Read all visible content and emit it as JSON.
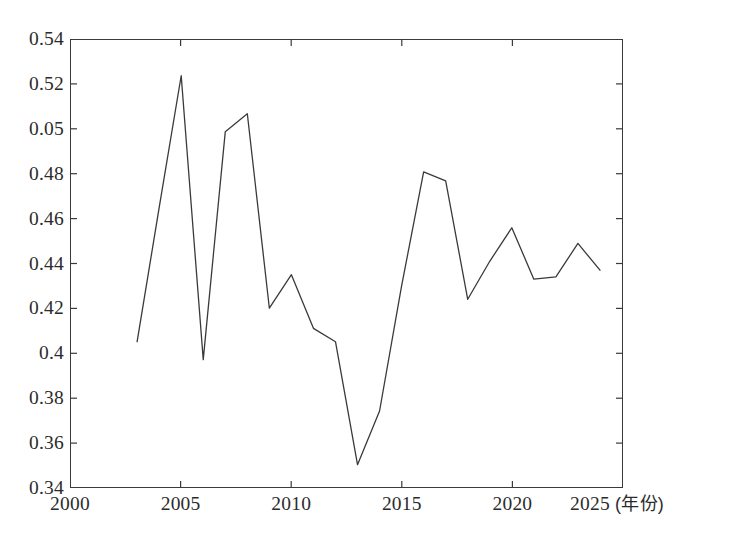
{
  "chart_data": {
    "type": "line",
    "title": "",
    "subtitle": "",
    "xlabel": "",
    "ylabel": "",
    "x_unit_label": "(年份)",
    "grid": false,
    "legend": null,
    "legend_position": "none",
    "xlim": [
      2000,
      2025
    ],
    "ylim": [
      0.34,
      0.54
    ],
    "x_tick_labels": [
      "2000",
      "2005",
      "2010",
      "2015",
      "2020",
      "2025"
    ],
    "x_ticks": [
      2000,
      2005,
      2010,
      2015,
      2020,
      2025
    ],
    "y_tick_labels": [
      "0.54",
      "0.52",
      "0.05",
      "0.48",
      "0.46",
      "0.44",
      "0.42",
      "0.4",
      "0.38",
      "0.36",
      "0.34"
    ],
    "y_ticks": [
      0.54,
      0.52,
      0.5,
      0.48,
      0.46,
      0.44,
      0.42,
      0.4,
      0.38,
      0.36,
      0.34
    ],
    "line_color": "#3a3a3a",
    "line_width": 1.3,
    "markers": false,
    "x": [
      2003,
      2004,
      2005,
      2006,
      2007,
      2008,
      2009,
      2010,
      2011,
      2012,
      2013,
      2014,
      2015,
      2016,
      2017,
      2018,
      2019,
      2020,
      2021,
      2022,
      2023,
      2024
    ],
    "values": [
      0.405,
      0.465,
      0.524,
      0.397,
      0.499,
      0.507,
      0.42,
      0.435,
      0.411,
      0.405,
      0.35,
      0.374,
      0.43,
      0.481,
      0.477,
      0.424,
      0.441,
      0.456,
      0.433,
      0.434,
      0.449,
      0.437
    ],
    "series": [
      {
        "name": "",
        "values": [
          0.405,
          0.465,
          0.524,
          0.397,
          0.499,
          0.507,
          0.42,
          0.435,
          0.411,
          0.405,
          0.35,
          0.374,
          0.43,
          0.481,
          0.477,
          0.424,
          0.441,
          0.456,
          0.433,
          0.434,
          0.449,
          0.437
        ]
      }
    ]
  }
}
